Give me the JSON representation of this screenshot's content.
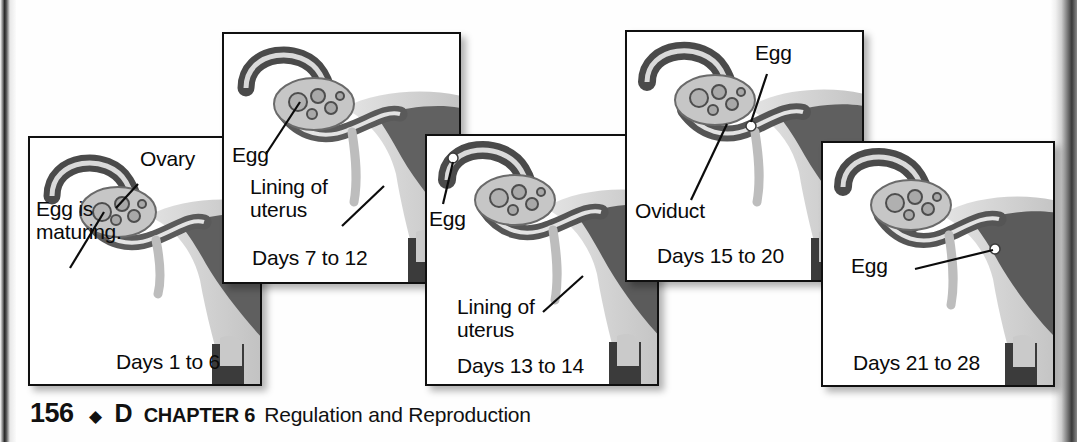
{
  "figure": {
    "caption_panels": 5,
    "panels": [
      {
        "id": "days-1-to-6",
        "days_label": "Days 1 to 6",
        "labels": [
          {
            "name": "ovary",
            "text": "Ovary"
          },
          {
            "name": "egg-maturing",
            "text": "Egg is\nmaturing."
          }
        ]
      },
      {
        "id": "days-7-to-12",
        "days_label": "Days 7 to 12",
        "labels": [
          {
            "name": "egg",
            "text": "Egg"
          },
          {
            "name": "lining-of-uterus",
            "text": "Lining of\nuterus"
          }
        ]
      },
      {
        "id": "days-13-to-14",
        "days_label": "Days 13 to 14",
        "labels": [
          {
            "name": "egg",
            "text": "Egg"
          },
          {
            "name": "lining-of-uterus",
            "text": "Lining of\nuterus"
          }
        ]
      },
      {
        "id": "days-15-to-20",
        "days_label": "Days 15 to 20",
        "labels": [
          {
            "name": "egg",
            "text": "Egg"
          },
          {
            "name": "oviduct",
            "text": "Oviduct"
          }
        ]
      },
      {
        "id": "days-21-to-28",
        "days_label": "Days 21 to 28",
        "labels": [
          {
            "name": "egg",
            "text": "Egg"
          }
        ]
      }
    ]
  },
  "footer": {
    "page_number": "156",
    "diamond": "◆",
    "unit_code": "D",
    "chapter": "CHAPTER 6",
    "title": "Regulation and Reproduction"
  },
  "colors": {
    "panel_border": "#101010",
    "page_background": "#ffffff",
    "text": "#0a0a0a",
    "organ_light": "#d6d6d6",
    "organ_mid": "#9a9a9a",
    "organ_dark": "#5c5c5c",
    "organ_darkest": "#3d3d3d"
  }
}
